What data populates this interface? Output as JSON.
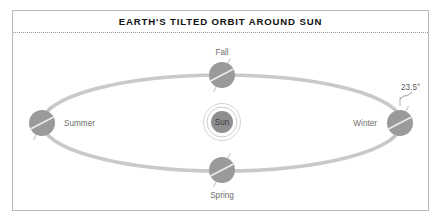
{
  "figure": {
    "title": "EARTH'S TILTED ORBIT AROUND SUN",
    "frame": {
      "border_color": "#b9b9b9",
      "background": "#ffffff"
    },
    "divider": {
      "style": "dotted",
      "color": "#9a9a9a"
    }
  },
  "colors": {
    "orbit": "#c9c9c9",
    "earth_fill": "#9a9a9a",
    "earth_equator": "#ededed",
    "axis_line": "#b5b5b5",
    "sun_fill": "#8f8f8f",
    "sun_ring": "#c4c4c4",
    "label_text": "#6e6e6e",
    "title_text": "#111111"
  },
  "orbit": {
    "center_x": 222,
    "center_y": 123,
    "radius_x": 180,
    "radius_y": 48,
    "stroke_width": 3.6
  },
  "sun": {
    "label": "Sun",
    "center_x": 222,
    "center_y": 122,
    "radius": 11,
    "ring_radii": [
      15,
      18.5
    ]
  },
  "earths": [
    {
      "season": "Fall",
      "center_x": 222,
      "center_y": 75,
      "radius": 13,
      "label_position": "above",
      "label_x": 222,
      "label_y": 53
    },
    {
      "season": "Winter",
      "center_x": 400,
      "center_y": 123,
      "radius": 13,
      "label_position": "left",
      "label_x": 378,
      "label_y": 125
    },
    {
      "season": "Spring",
      "center_x": 222,
      "center_y": 170,
      "radius": 13,
      "label_position": "below",
      "label_x": 222,
      "label_y": 196
    },
    {
      "season": "Summer",
      "center_x": 42,
      "center_y": 123,
      "radius": 13,
      "label_position": "right",
      "label_x": 64,
      "label_y": 125
    }
  ],
  "tilt": {
    "label": "23.5°",
    "degrees": 23.5,
    "label_x": 404,
    "label_y": 90,
    "marker_x": 395,
    "marker_y": 100
  }
}
